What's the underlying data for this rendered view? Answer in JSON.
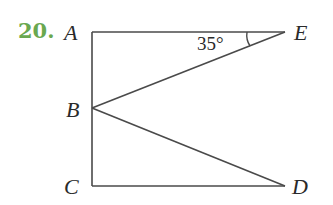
{
  "problem": {
    "number": "20.",
    "number_color": "#6aa84f"
  },
  "diagram": {
    "points": {
      "A": {
        "label": "A",
        "x": 92,
        "y": 32
      },
      "E": {
        "label": "E",
        "x": 285,
        "y": 32
      },
      "B": {
        "label": "B",
        "x": 92,
        "y": 108
      },
      "C": {
        "label": "C",
        "x": 92,
        "y": 186
      },
      "D": {
        "label": "D",
        "x": 285,
        "y": 186
      }
    },
    "segments": [
      "AE",
      "AC",
      "CD",
      "BE",
      "BD"
    ],
    "angle": {
      "vertex": "E",
      "label": "35°"
    }
  }
}
